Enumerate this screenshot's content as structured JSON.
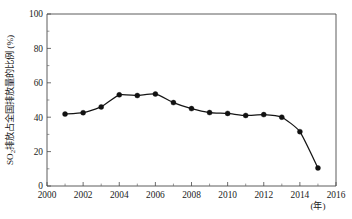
{
  "chart_data": {
    "type": "line",
    "title": "",
    "subtitle": "",
    "xlabel": "(年)",
    "ylabel": "SO₂排放占全国排放量的比例 (%)",
    "ylabel_parts": {
      "species": "SO",
      "subscript": "2",
      "rest": "排放占全国排放量的比例 (%)"
    },
    "x": [
      2001,
      2002,
      2003,
      2004,
      2005,
      2006,
      2007,
      2008,
      2009,
      2010,
      2011,
      2012,
      2013,
      2014,
      2015
    ],
    "values": [
      41.8,
      42.6,
      46.0,
      53.0,
      52.6,
      53.5,
      48.5,
      45.0,
      42.7,
      42.2,
      41.0,
      41.5,
      40.0,
      31.6,
      10.5
    ],
    "series": [
      {
        "name": "SO₂排放占全国排放量的比例",
        "values": [
          41.8,
          42.6,
          46.0,
          53.0,
          52.6,
          53.5,
          48.5,
          45.0,
          42.7,
          42.2,
          41.0,
          41.5,
          40.0,
          31.6,
          10.5
        ]
      }
    ],
    "xlim": [
      2000,
      2016
    ],
    "ylim": [
      0,
      100
    ],
    "xticks": [
      2000,
      2002,
      2004,
      2006,
      2008,
      2010,
      2012,
      2014,
      2016
    ],
    "xtick_labels": [
      "2000",
      "2002",
      "2004",
      "2006",
      "2008",
      "2010",
      "2012",
      "2014",
      "2016"
    ],
    "xticks_minor": [
      2001,
      2003,
      2005,
      2007,
      2009,
      2011,
      2013,
      2015
    ],
    "yticks": [
      0,
      20,
      40,
      60,
      80,
      100
    ],
    "ytick_labels": [
      "0",
      "20",
      "40",
      "60",
      "80",
      "100"
    ],
    "yticks_minor": [
      10,
      30,
      50,
      70,
      90
    ],
    "grid": false,
    "legend": false,
    "legend_position": "none",
    "marker": "filled-circle",
    "line_color": "#151515",
    "marker_color": "#111111",
    "axis_color": "#4a4a4a",
    "background_color": "#ffffff",
    "annotations": []
  }
}
